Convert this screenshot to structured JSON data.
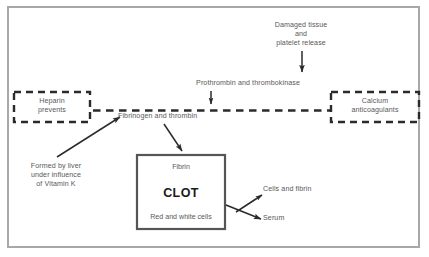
{
  "diagram": {
    "colors": {
      "frame": "#a8a8a8",
      "text": "#595959",
      "clot_border": "#555555",
      "clot_text": "#1a1a1a",
      "dashed": "#2b2b2b",
      "arrow": "#2b2b2b",
      "background": "#ffffff"
    },
    "nodes": {
      "damaged_tissue": "Damaged tissue\nand\nplatelet release",
      "prothrombin": "Prothrombin and thrombokinase",
      "fibrinogen": "Fibrinogen and thrombin",
      "heparin": "Heparin\nprevents",
      "calcium": "Calcium\nanticoagulants",
      "formed_by_liver": "Formed by liver\nunder influence\nof Vitamin K",
      "cells_and_fibrin": "Cells and fibrin",
      "serum": "Serum"
    },
    "clot_box": {
      "top_label": "Fibrin",
      "main_label": "CLOT",
      "bottom_label": "Red and white cells"
    },
    "icons": {
      "arrow_down": "arrow-down-icon",
      "arrow_diagonal": "arrow-diagonal-icon",
      "dashed_line": "dashed-line-icon"
    }
  }
}
